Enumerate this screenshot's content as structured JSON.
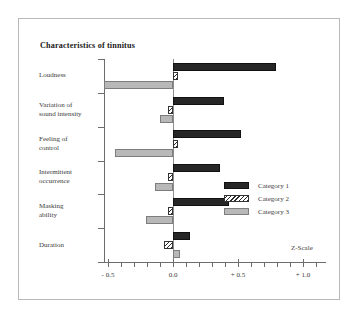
{
  "figure": {
    "title": "Characteristics of tinnitus",
    "axis_label": "Z-Scale"
  },
  "legend": {
    "position": "right-middle",
    "entries": [
      {
        "label": "Category 1",
        "swatch": "solid-black"
      },
      {
        "label": "Category 2",
        "swatch": "diagonal-hatch"
      },
      {
        "label": "Category 3",
        "swatch": "light-gray"
      }
    ]
  },
  "chart_data": {
    "type": "bar",
    "orientation": "horizontal",
    "title": "Characteristics of tinnitus",
    "xlabel": "Z-Scale",
    "ylabel": "",
    "xlim": [
      -0.62,
      1.18
    ],
    "xticks": [
      -0.5,
      0.0,
      0.5,
      1.0
    ],
    "xticklabels": [
      "- 0.5",
      "0.0",
      "+ 0.5",
      "+ 1.0"
    ],
    "minor_tick_step": 0.1,
    "grid": false,
    "zero_reference_line": true,
    "categories": [
      "Loudness",
      "Variation of sound intensity",
      "Feeling of control",
      "Intermittent occurrence",
      "Masking ability",
      "Duration"
    ],
    "series": [
      {
        "name": "Category 1",
        "values": [
          0.79,
          0.39,
          0.52,
          0.36,
          0.43,
          0.13
        ]
      },
      {
        "name": "Category 2",
        "values": [
          0.01,
          -0.04,
          0.02,
          -0.01,
          -0.02,
          -0.07
        ]
      },
      {
        "name": "Category 3",
        "values": [
          -0.53,
          -0.1,
          -0.45,
          -0.14,
          -0.21,
          0.05
        ]
      }
    ]
  },
  "category_label_lines": [
    [
      "Loudness"
    ],
    [
      "Variation of",
      "sound intensity"
    ],
    [
      "Feeling of",
      "control"
    ],
    [
      "Intermittent",
      "occurrence"
    ],
    [
      "Masking",
      "ability"
    ],
    [
      "Duration"
    ]
  ],
  "colors": {
    "category_1": "#262626",
    "category_2": "#2a2a2a",
    "category_3": "#b8b8b8",
    "axis": "#6d6d6d",
    "border": "#b9b9b9",
    "background": "#ffffff"
  }
}
